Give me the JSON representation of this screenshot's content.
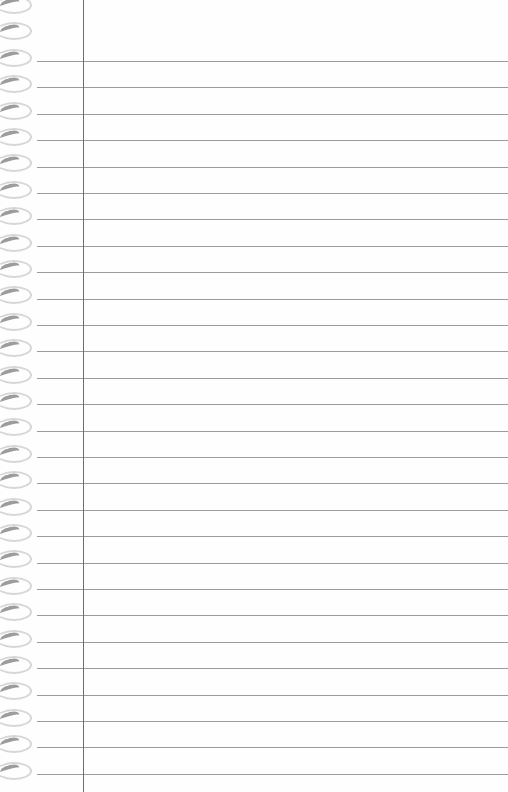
{
  "page": {
    "type": "blank ruled notebook paper",
    "colors": {
      "paper": "#fefefe",
      "rule": "#8a8a8a",
      "margin_line": "#6e6e6e",
      "ring": "#9c9c9c"
    },
    "rules": {
      "count": 28,
      "first_y": 61,
      "spacing": 26.4,
      "left_x": 37
    },
    "margin_line_x": 83,
    "rings": {
      "count": 30,
      "first_y": 0,
      "spacing": 26.4
    }
  }
}
